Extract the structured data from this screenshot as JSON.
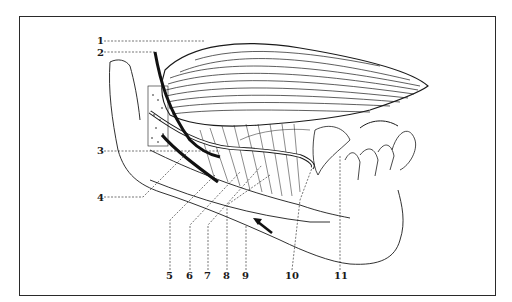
{
  "figure": {
    "type": "anatomical-line-illustration",
    "colors": {
      "ink": "#1a1a1a",
      "paper": "#ffffff",
      "frame": "#2a2a2a"
    }
  },
  "labels": {
    "left": [
      {
        "id": "1",
        "text": "1"
      },
      {
        "id": "2",
        "text": "2"
      },
      {
        "id": "3",
        "text": "3"
      },
      {
        "id": "4",
        "text": "4"
      }
    ],
    "bottom": [
      {
        "id": "5",
        "text": "5"
      },
      {
        "id": "6",
        "text": "6"
      },
      {
        "id": "7",
        "text": "7"
      },
      {
        "id": "8",
        "text": "8"
      },
      {
        "id": "9",
        "text": "9"
      },
      {
        "id": "10",
        "text": "10"
      },
      {
        "id": "11",
        "text": "11"
      }
    ]
  },
  "annotations": {
    "arrow": "black arrow pointing up-left toward lower border of mandible"
  }
}
